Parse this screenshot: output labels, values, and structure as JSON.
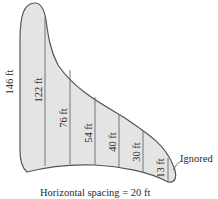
{
  "diagram": {
    "shape_fill": "#e4e4e4",
    "outline_color": "#555555",
    "line_color": "#6a6a6a",
    "measurements": [
      {
        "label": "146 ft",
        "x": 12,
        "y": 95
      },
      {
        "label": "122 ft",
        "x": 41,
        "y": 90
      },
      {
        "label": "76 ft",
        "x": 66,
        "y": 120
      },
      {
        "label": "54 ft",
        "x": 91,
        "y": 133
      },
      {
        "label": "40 ft",
        "x": 115,
        "y": 142
      },
      {
        "label": "30 ft",
        "x": 139,
        "y": 155
      },
      {
        "label": "13 ft",
        "x": 163,
        "y": 166
      }
    ],
    "annotation": "Ignored",
    "caption": "Horizontal spacing = 20 ft"
  }
}
